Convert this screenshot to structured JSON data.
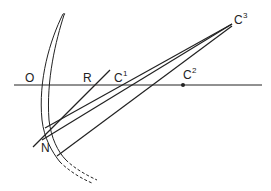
{
  "diagram": {
    "type": "geometric optics construction",
    "colors": {
      "ink": "#222222",
      "background": "#ffffff"
    },
    "labels": {
      "O": {
        "text": "O"
      },
      "R": {
        "text": "R"
      },
      "C1": {
        "base": "C",
        "sup": "1"
      },
      "C2": {
        "base": "C",
        "sup": "2"
      },
      "C3": {
        "base": "C",
        "sup": "3"
      },
      "N": {
        "text": "N"
      }
    },
    "elements": [
      "optical-axis",
      "lens-surface-arc",
      "ray-R-line",
      "ray-to-C1",
      "ray-to-C3-upper",
      "ray-to-C3-lower",
      "point-C2"
    ]
  }
}
